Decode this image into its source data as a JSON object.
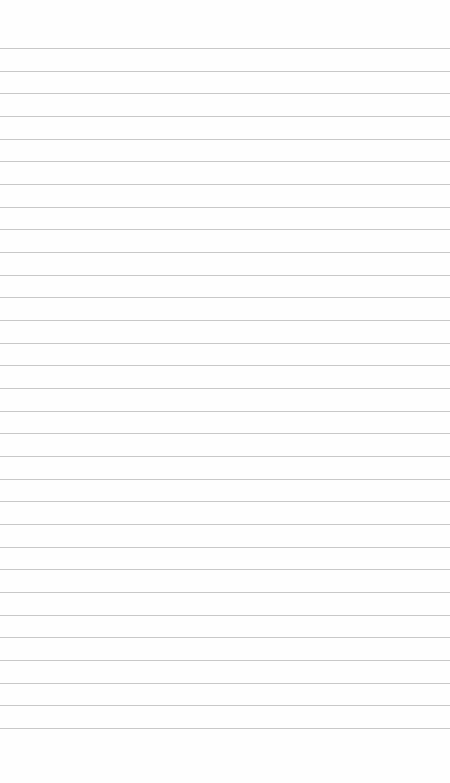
{
  "page": {
    "type": "lined-paper",
    "background_color": "#fefefe",
    "line_color": "#c8c8c8",
    "line_count": 31,
    "first_line_y": 48,
    "line_spacing": 22.67,
    "text": ""
  }
}
